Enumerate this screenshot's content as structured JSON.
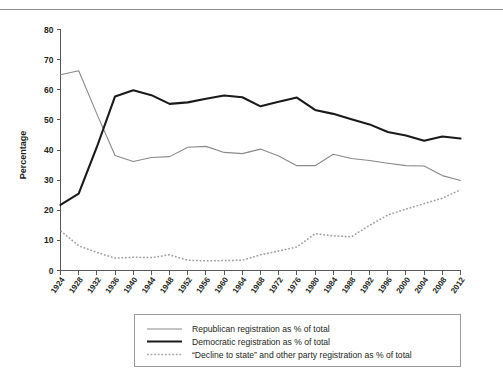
{
  "page": {
    "has_top_rule": true,
    "background_color": "#ffffff"
  },
  "chart_data": {
    "type": "line",
    "title": "",
    "subtitle": "",
    "xlabel": "",
    "ylabel": "Percentage",
    "ylim": [
      0,
      80
    ],
    "ytick_step": 10,
    "yticks": [
      0,
      10,
      20,
      30,
      40,
      50,
      60,
      70,
      80
    ],
    "grid": false,
    "legend_position": "bottom",
    "categories": [
      "1924",
      "1928",
      "1932",
      "1936",
      "1940",
      "1944",
      "1948",
      "1952",
      "1956",
      "1960",
      "1964",
      "1968",
      "1972",
      "1976",
      "1980",
      "1984",
      "1988",
      "1992",
      "1996",
      "2000",
      "2004",
      "2008",
      "2012"
    ],
    "series": [
      {
        "name": "Republican registration as % of total",
        "key": "republican",
        "color": "#8a8a8a",
        "style": "solid",
        "width": 1.1,
        "values": [
          65.0,
          66.3,
          52.0,
          38.2,
          36.2,
          37.5,
          37.8,
          40.9,
          41.2,
          39.2,
          38.8,
          40.3,
          38.0,
          34.8,
          34.8,
          38.6,
          37.2,
          36.5,
          35.6,
          34.8,
          34.7,
          31.5,
          29.9
        ]
      },
      {
        "name": "Democratic registration as % of total",
        "key": "democratic",
        "color": "#1a1a1a",
        "style": "solid",
        "width": 2.1,
        "values": [
          21.8,
          25.5,
          41.0,
          57.8,
          59.8,
          58.2,
          55.3,
          55.8,
          57.0,
          58.1,
          57.5,
          54.5,
          56.0,
          57.4,
          53.3,
          52.0,
          50.2,
          48.5,
          46.0,
          44.8,
          43.1,
          44.5,
          43.8
        ]
      },
      {
        "name": "“Decline to state” and other party registration as % of total",
        "key": "decline_to_state",
        "color": "#9d9d9d",
        "style": "dotted",
        "width": 1.5,
        "values": [
          13.2,
          8.2,
          6.0,
          4.1,
          4.4,
          4.3,
          5.2,
          3.4,
          3.2,
          3.3,
          3.4,
          5.2,
          6.5,
          7.8,
          12.2,
          11.5,
          11.2,
          15.0,
          18.4,
          20.4,
          22.2,
          24.0,
          26.8
        ]
      }
    ]
  },
  "legend": {
    "items": [
      {
        "label": "Republican registration as % of total",
        "swatch": "solid-gray-line"
      },
      {
        "label": "Democratic registration as % of total",
        "swatch": "solid-black-line"
      },
      {
        "label": "“Decline to state” and other party registration as % of total",
        "swatch": "dotted-gray-line"
      }
    ]
  },
  "axes": {
    "y_title": "Percentage",
    "y_labels": [
      "0",
      "10",
      "20",
      "30",
      "40",
      "50",
      "60",
      "70",
      "80"
    ],
    "x_labels": [
      "1924",
      "1928",
      "1932",
      "1936",
      "1940",
      "1944",
      "1948",
      "1952",
      "1956",
      "1960",
      "1964",
      "1968",
      "1972",
      "1976",
      "1980",
      "1984",
      "1988",
      "1992",
      "1996",
      "2000",
      "2004",
      "2008",
      "2012"
    ]
  }
}
